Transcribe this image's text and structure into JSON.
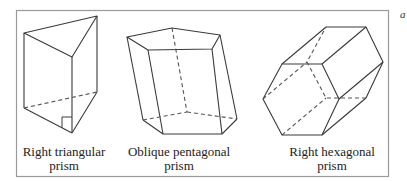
{
  "figure": {
    "frame": {
      "x": 16,
      "y": 10,
      "width": 373,
      "height": 167,
      "stroke": "#9a9a9a"
    },
    "line_color": "#3a3a3a",
    "hidden_line_color": "#555555",
    "corner_mark": "a",
    "prisms": [
      {
        "name": "right-triangular-prism",
        "label_line1": "Right triangular",
        "label_line2": "prism",
        "label_center_x": 64
      },
      {
        "name": "oblique-pentagonal-prism",
        "label_line1": "Oblique pentagonal",
        "label_line2": "prism",
        "label_center_x": 179
      },
      {
        "name": "right-hexagonal-prism",
        "label_line1": "Right hexagonal",
        "label_line2": "prism",
        "label_center_x": 332
      }
    ]
  }
}
